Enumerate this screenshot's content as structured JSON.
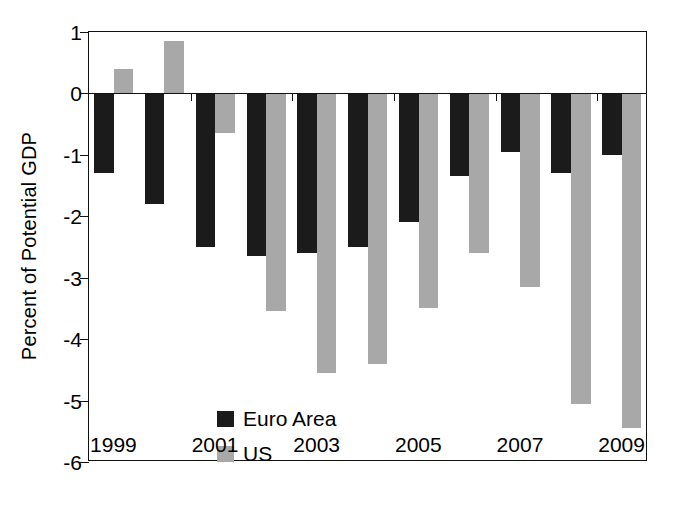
{
  "chart_data": {
    "type": "bar",
    "title": "",
    "subtitle": "",
    "xlabel": "",
    "ylabel": "Percent of Potential GDP",
    "categories": [
      "1999",
      "2000",
      "2001",
      "2002",
      "2003",
      "2004",
      "2005",
      "2006",
      "2007",
      "2008",
      "2009"
    ],
    "x_tick_labels": [
      "1999",
      "2001",
      "2003",
      "2005",
      "2007",
      "2009"
    ],
    "y_tick_labels": [
      "1",
      "0",
      "-1",
      "-2",
      "-3",
      "-4",
      "-5",
      "-6"
    ],
    "ylim": [
      -6,
      1
    ],
    "y_tick_values": [
      1,
      0,
      -1,
      -2,
      -3,
      -4,
      -5,
      -6
    ],
    "grid": false,
    "legend_position": "inside-lower-left",
    "series": [
      {
        "name": "Euro Area",
        "color": "#1b1b1b",
        "values": [
          -1.3,
          -1.8,
          -2.5,
          -2.65,
          -2.6,
          -2.5,
          -2.1,
          -1.35,
          -0.95,
          -1.3,
          -1.0
        ]
      },
      {
        "name": "US",
        "color": "#a8a8a8",
        "values": [
          0.4,
          0.85,
          -0.65,
          -3.55,
          -4.55,
          -4.4,
          -3.5,
          -2.6,
          -3.15,
          -5.05,
          -5.45
        ]
      }
    ]
  },
  "legend": {
    "items": [
      {
        "label": "Euro Area",
        "color": "#1b1b1b"
      },
      {
        "label": "US",
        "color": "#a8a8a8"
      }
    ]
  },
  "axes": {
    "y_title": "Percent of Potential GDP"
  }
}
